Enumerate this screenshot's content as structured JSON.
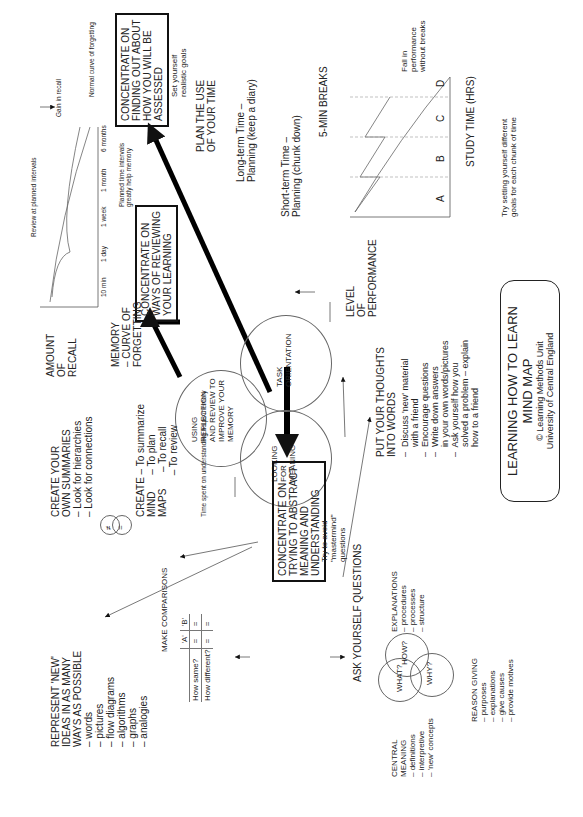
{
  "title": {
    "main": "LEARNING HOW TO LEARN MIND MAP",
    "credit1": "© Learning Methods Unit",
    "credit2": "University of Central England"
  },
  "center": {
    "reflection": "USING\nREFLECTION\nAND REVIEW TO\nIMPROVE YOUR\nMEMORY",
    "task": "TASK\nORIENTATION",
    "meaning": "LOOKING\nFOR\nMEANING"
  },
  "boxes": {
    "assessed": "CONCENTRATE ON\nFINDING OUT ABOUT\nHOW YOU WILL BE\nASSESSED",
    "reviewing": "CONCENTRATE ON\nWAYS OF REVIEWING\nYOUR LEARNING",
    "abstract": "CONCENTRATE ON\nTRYING TO ABSTRACT\nMEANING AND\nUNDERSTANDING"
  },
  "time": {
    "goals": "Set yourself\nrealistic goals",
    "plan": "PLAN THE USE\nOF YOUR TIME",
    "long_term": "Long-term Time –\nPlanning (keep a diary)",
    "short_term": "Short-term Time –\nPlanning (chunk down)",
    "breaks": "5-MIN BREAKS",
    "fall": "Fall in\nperformance\nwithout breaks",
    "level": "LEVEL\nOF\nPERFORMANCE",
    "study_time": "STUDY TIME (HRS)",
    "chunk_goals": "Try setting yourself different\ngoals for each chunk of time",
    "chunks": [
      "A",
      "B",
      "C",
      "D"
    ]
  },
  "memory": {
    "review_intervals": "Review at planned intervals",
    "gain": "Gain in recall",
    "normal_curve": "Normal curve of forgetting",
    "planned_note": "Planned time intervals\ngreatly help memory",
    "amount": "AMOUNT\nOF\nRECALL",
    "curve_label": "MEMORY\n– CURVE OF\nFORGETTING",
    "ticks": [
      "10 min",
      "1 day",
      "1 week",
      "1 month",
      "6 months"
    ]
  },
  "thoughts": {
    "heading": "PUT YOUR THOUGHTS\nINTO WORDS",
    "items": [
      "–  Discuss 'new' material\n    with a friend",
      "–  Encourage questions",
      "–  Write down answers\n    in your own words/pictures",
      "–  Ask yourself how you\n    solved a problem – explain\n    how to a friend"
    ]
  },
  "questions": {
    "heading": "ASK YOURSELF QUESTIONS",
    "mastermind": "Try to avoid\n\"mastermind\"\nquestions",
    "what": "WHAT?",
    "how": "HOW?",
    "why": "WHY?",
    "explanations": "EXPLANATIONS\n– procedures\n– processes\n– structure",
    "central": "CENTRAL\nMEANING\n– definitions\n– interpretive\n– 'new' concepts",
    "reason": "REASON GIVING\n– purposes\n– explanations\n– give causes\n– provide motives"
  },
  "understanding": {
    "time_spent": "Time spent on understanding helps memory",
    "summaries": "CREATE YOUR\nOWN SUMMARIES\n– Look for hierarchies\n– Look for connections",
    "mindmaps": "CREATE – To summarize\nMIND      – To plan\nMAPS      – To recall\n               – To review",
    "represent": "REPRESENT 'NEW'\nIDEAS IN AS MANY\nWAYS AS POSSIBLE\n– words\n– pictures\n– flow diagrams\n– algorithms\n– graphs\n– analogies",
    "comparisons": "MAKE COMPARISONS",
    "table": {
      "headers": [
        "",
        "'A'",
        "'B'"
      ],
      "rows": [
        [
          "How same?",
          "=",
          "="
        ],
        [
          "How different?",
          "=",
          "="
        ]
      ]
    },
    "venn_left": "≠",
    "venn_right": "="
  }
}
